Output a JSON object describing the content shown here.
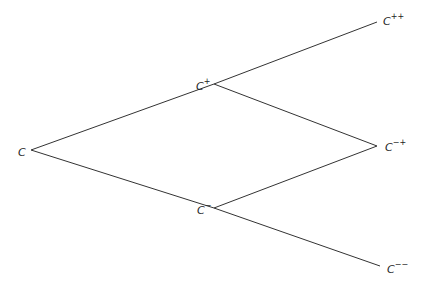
{
  "diagram": {
    "type": "binomial-tree",
    "nodes": [
      {
        "id": "root",
        "base": "C",
        "sup": "",
        "x": 18,
        "y": 145
      },
      {
        "id": "up",
        "base": "C",
        "sup": "+",
        "x": 196,
        "y": 79
      },
      {
        "id": "down",
        "base": "C",
        "sup": "−",
        "x": 197,
        "y": 203
      },
      {
        "id": "upup",
        "base": "C",
        "sup": "++",
        "x": 383,
        "y": 14
      },
      {
        "id": "updown",
        "base": "C",
        "sup": "−+",
        "x": 385,
        "y": 140
      },
      {
        "id": "downdown",
        "base": "C",
        "sup": "−−",
        "x": 387,
        "y": 262
      }
    ],
    "edges": [
      {
        "from": "root",
        "to": "up",
        "x1": 31,
        "y1": 150,
        "x2": 214,
        "y2": 84
      },
      {
        "from": "root",
        "to": "down",
        "x1": 31,
        "y1": 150,
        "x2": 214,
        "y2": 208
      },
      {
        "from": "up",
        "to": "upup",
        "x1": 214,
        "y1": 84,
        "x2": 377,
        "y2": 22
      },
      {
        "from": "up",
        "to": "updown",
        "x1": 214,
        "y1": 84,
        "x2": 377,
        "y2": 146
      },
      {
        "from": "down",
        "to": "updown",
        "x1": 214,
        "y1": 208,
        "x2": 377,
        "y2": 146
      },
      {
        "from": "down",
        "to": "downdown",
        "x1": 214,
        "y1": 208,
        "x2": 380,
        "y2": 266
      }
    ],
    "line_color": "#333333"
  }
}
